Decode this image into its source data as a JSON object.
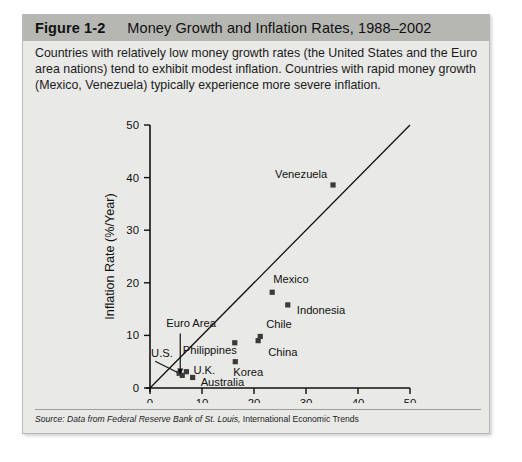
{
  "figure": {
    "number": "Figure 1-2",
    "title": "Money Growth and Inflation Rates, 1988–2002",
    "caption": "Countries with relatively low money growth rates (the United States and the Euro area nations) tend to exhibit modest inflation. Countries with rapid money growth (Mexico, Venezuela) typically experience more severe inflation.",
    "source_italic": "Source: Data from Federal Reserve Bank of St. Louis,",
    "source_regular": " International Economic Trends"
  },
  "colors": {
    "header_band": "#b6b6b3",
    "figure_background": "#e9e9e7",
    "border": "#b9b9b6",
    "marker": "#3a3a3a",
    "axis": "#111111"
  },
  "chart_data": {
    "type": "scatter",
    "title": "Money Growth and Inflation Rates, 1988–2002",
    "xlabel": "Broad Money Growth Rate (%/Year)",
    "ylabel": "Inflation Rate (%/Year)",
    "xlim": [
      0,
      50
    ],
    "ylim": [
      0,
      50
    ],
    "xticks": [
      0,
      10,
      20,
      30,
      40,
      50
    ],
    "yticks": [
      0,
      10,
      20,
      30,
      40,
      50
    ],
    "grid": false,
    "legend": "none",
    "reference_line": {
      "name": "45-degree line",
      "from": [
        0,
        0
      ],
      "to": [
        50,
        50
      ]
    },
    "points": [
      {
        "label": "U.S.",
        "x": 5.6,
        "y": 2.8,
        "label_dx": -28,
        "label_dy": -16,
        "leader": true
      },
      {
        "label": "Euro Area",
        "x": 6.2,
        "y": 2.4,
        "label_dx": -16,
        "label_dy": -48,
        "leader": true
      },
      {
        "label": "U.K.",
        "x": 7.0,
        "y": 3.1,
        "label_dx": 7,
        "label_dy": 2
      },
      {
        "label": "Australia",
        "x": 8.2,
        "y": 2.0,
        "label_dx": 8,
        "label_dy": 9
      },
      {
        "label": "Philippines",
        "x": 16.3,
        "y": 8.6,
        "label_dx": -52,
        "label_dy": 11
      },
      {
        "label": "Korea",
        "x": 16.4,
        "y": 5.0,
        "label_dx": -2,
        "label_dy": 14
      },
      {
        "label": "China",
        "x": 20.8,
        "y": 9.0,
        "label_dx": 10,
        "label_dy": 15
      },
      {
        "label": "Chile",
        "x": 21.2,
        "y": 9.8,
        "label_dx": 6,
        "label_dy": -8
      },
      {
        "label": "Mexico",
        "x": 23.5,
        "y": 18.2,
        "label_dx": 1,
        "label_dy": -9
      },
      {
        "label": "Indonesia",
        "x": 26.5,
        "y": 15.8,
        "label_dx": 9,
        "label_dy": 9
      },
      {
        "label": "Venezuela",
        "x": 35.2,
        "y": 38.6,
        "label_dx": -58,
        "label_dy": -7
      }
    ]
  }
}
